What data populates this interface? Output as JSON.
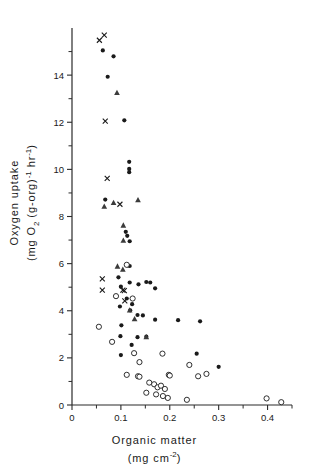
{
  "chart_data": {
    "type": "scatter",
    "title": "",
    "xlabel": "Organic matter (mg cm-2)",
    "ylabel": "Oxygen uptake (mg O2 (g-org)-1 hr-1)",
    "xlim": [
      0,
      0.45
    ],
    "ylim": [
      0,
      16
    ],
    "grid": false,
    "legend_position": "none",
    "xticks": [
      "0",
      "0.1",
      "0.2",
      "0.3",
      "0.4"
    ],
    "xtick_values": [
      0,
      0.1,
      0.2,
      0.3,
      0.4
    ],
    "yticks": [
      "0",
      "2",
      "4",
      "6",
      "8",
      "10",
      "12",
      "14"
    ],
    "ytick_values": [
      0,
      2,
      4,
      6,
      8,
      10,
      12,
      14
    ],
    "xminor_step": 0.05,
    "yminor_step": 1,
    "series": [
      {
        "name": "filled-circle",
        "marker": "filled-circle",
        "points": [
          [
            0.063,
            15.05
          ],
          [
            0.085,
            14.8
          ],
          [
            0.073,
            13.93
          ],
          [
            0.107,
            12.08
          ],
          [
            0.117,
            10.32
          ],
          [
            0.117,
            10.02
          ],
          [
            0.117,
            9.88
          ],
          [
            0.068,
            8.72
          ],
          [
            0.11,
            7.35
          ],
          [
            0.113,
            7.18
          ],
          [
            0.118,
            6.95
          ],
          [
            0.114,
            5.92
          ],
          [
            0.118,
            5.9
          ],
          [
            0.095,
            5.42
          ],
          [
            0.118,
            5.2
          ],
          [
            0.1,
            5.02
          ],
          [
            0.136,
            5.12
          ],
          [
            0.152,
            5.22
          ],
          [
            0.16,
            5.2
          ],
          [
            0.17,
            4.95
          ],
          [
            0.112,
            4.52
          ],
          [
            0.123,
            4.28
          ],
          [
            0.098,
            4.18
          ],
          [
            0.119,
            4.02
          ],
          [
            0.134,
            3.82
          ],
          [
            0.145,
            3.8
          ],
          [
            0.101,
            3.38
          ],
          [
            0.17,
            3.62
          ],
          [
            0.217,
            3.6
          ],
          [
            0.262,
            3.55
          ],
          [
            0.099,
            2.92
          ],
          [
            0.134,
            2.88
          ],
          [
            0.152,
            2.9
          ],
          [
            0.122,
            2.55
          ],
          [
            0.1,
            2.12
          ],
          [
            0.255,
            2.18
          ],
          [
            0.3,
            1.62
          ]
        ]
      },
      {
        "name": "open-circle",
        "marker": "open-circle",
        "points": [
          [
            0.112,
            5.95
          ],
          [
            0.09,
            4.62
          ],
          [
            0.124,
            4.52
          ],
          [
            0.055,
            3.32
          ],
          [
            0.127,
            2.2
          ],
          [
            0.185,
            2.18
          ],
          [
            0.138,
            1.82
          ],
          [
            0.24,
            1.7
          ],
          [
            0.275,
            1.32
          ],
          [
            0.112,
            1.28
          ],
          [
            0.135,
            1.22
          ],
          [
            0.138,
            1.2
          ],
          [
            0.198,
            1.28
          ],
          [
            0.2,
            1.25
          ],
          [
            0.258,
            1.22
          ],
          [
            0.158,
            0.95
          ],
          [
            0.168,
            0.88
          ],
          [
            0.175,
            0.75
          ],
          [
            0.182,
            0.82
          ],
          [
            0.19,
            0.68
          ],
          [
            0.152,
            0.52
          ],
          [
            0.172,
            0.45
          ],
          [
            0.186,
            0.38
          ],
          [
            0.196,
            0.3
          ],
          [
            0.235,
            0.22
          ],
          [
            0.398,
            0.28
          ],
          [
            0.428,
            0.12
          ],
          [
            0.082,
            2.68
          ]
        ]
      },
      {
        "name": "triangle",
        "marker": "triangle",
        "points": [
          [
            0.092,
            13.25
          ],
          [
            0.066,
            8.42
          ],
          [
            0.085,
            8.58
          ],
          [
            0.135,
            8.7
          ],
          [
            0.105,
            7.62
          ],
          [
            0.105,
            6.98
          ],
          [
            0.093,
            5.88
          ],
          [
            0.104,
            5.75
          ],
          [
            0.118,
            4.02
          ],
          [
            0.128,
            3.65
          ],
          [
            0.152,
            2.88
          ]
        ]
      },
      {
        "name": "cross",
        "marker": "cross",
        "points": [
          [
            0.056,
            15.48
          ],
          [
            0.066,
            15.7
          ],
          [
            0.068,
            12.05
          ],
          [
            0.072,
            9.62
          ],
          [
            0.098,
            8.52
          ],
          [
            0.062,
            5.35
          ],
          [
            0.062,
            4.88
          ],
          [
            0.104,
            4.88
          ],
          [
            0.107,
            4.85
          ],
          [
            0.108,
            4.42
          ]
        ]
      }
    ]
  },
  "labels": {
    "y_line1": "Oxygen  uptake",
    "y_line2_pre": "(mg O",
    "y_line2_sub": "2",
    "y_line2_mid": "  (g-org)",
    "y_line2_sup1": "-1",
    "y_line2_tail": " hr",
    "y_line2_sup2": "-1",
    "y_line2_end": ")",
    "x_line1": "Organic   matter",
    "x_line2_pre": "(mg   cm",
    "x_line2_sup": "-2",
    "x_line2_end": ")"
  }
}
